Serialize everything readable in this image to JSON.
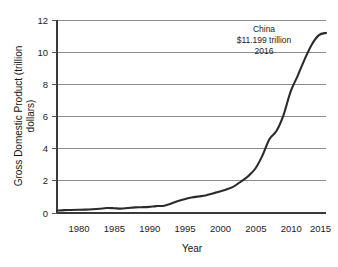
{
  "chart_data": {
    "type": "line",
    "title": "",
    "xlabel": "Year",
    "ylabel": "Gross Domestic Product (trillion dollars)",
    "ylabel_line1": "Gross Domestic Product (trillion",
    "ylabel_line2": "dollars)",
    "xlim": [
      1978,
      2016
    ],
    "ylim": [
      0,
      12
    ],
    "grid": true,
    "grid_axis": "y",
    "legend": false,
    "line_color": "#2b2b2b",
    "background_color": "#ffffff",
    "xticks": [
      1980,
      1985,
      1990,
      1995,
      2000,
      2005,
      2010,
      2015
    ],
    "xtick_labels": [
      "1980",
      "1985",
      "1990",
      "1995",
      "2000",
      "2005",
      "2010",
      "2015"
    ],
    "yticks": [
      0,
      2,
      4,
      6,
      8,
      10,
      12
    ],
    "ytick_labels": [
      "0",
      "2",
      "4",
      "6",
      "8",
      "10",
      "12"
    ],
    "series": [
      {
        "name": "China GDP",
        "x": [
          1978,
          1979,
          1980,
          1981,
          1982,
          1983,
          1984,
          1985,
          1986,
          1987,
          1988,
          1989,
          1990,
          1991,
          1992,
          1993,
          1994,
          1995,
          1996,
          1997,
          1998,
          1999,
          2000,
          2001,
          2002,
          2003,
          2004,
          2005,
          2006,
          2007,
          2008,
          2009,
          2010,
          2011,
          2012,
          2013,
          2014,
          2015,
          2016
        ],
        "values": [
          0.15,
          0.18,
          0.19,
          0.2,
          0.21,
          0.23,
          0.26,
          0.31,
          0.3,
          0.27,
          0.31,
          0.35,
          0.36,
          0.38,
          0.43,
          0.44,
          0.56,
          0.73,
          0.86,
          0.96,
          1.03,
          1.09,
          1.21,
          1.34,
          1.47,
          1.66,
          1.96,
          2.29,
          2.75,
          3.55,
          4.59,
          5.1,
          6.09,
          7.55,
          8.53,
          9.57,
          10.48,
          11.06,
          11.199
        ]
      }
    ],
    "annotation": {
      "line1": "China",
      "line2": "$11.199 trillion",
      "line3": "2016",
      "x": 2011.5,
      "y": 11.0
    }
  },
  "axes_geometry": {
    "plot_left": 57,
    "plot_right": 326,
    "plot_top": 20,
    "plot_bottom": 213
  }
}
